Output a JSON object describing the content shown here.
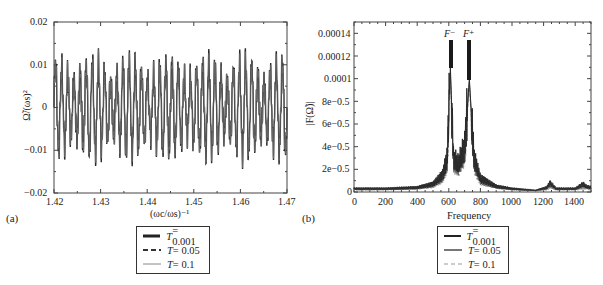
{
  "chart_data": [
    {
      "panel": "(a)",
      "type": "line",
      "title": "",
      "xlabel": "(ω_c/ω_s)^-1",
      "ylabel": "Ω̃/(ω_s)^2",
      "xlim": [
        1.42,
        1.47
      ],
      "ylim": [
        -0.02,
        0.02
      ],
      "x_ticks": [
        "1.42",
        "1.43",
        "1.44",
        "1.45",
        "1.46",
        "1.47"
      ],
      "y_ticks": [
        "-0.02",
        "-0.01",
        "0",
        "0.01",
        "0.02"
      ],
      "grid": false,
      "legend_position": "below",
      "series": [
        {
          "name": "T = 0.001",
          "style": "thick solid",
          "description": "oscillating signal, amplitude roughly between -0.013 and 0.013"
        },
        {
          "name": "T = 0.05",
          "style": "dashed",
          "description": "nearly overlapping oscillation"
        },
        {
          "name": "T = 0.1",
          "style": "thin solid gray",
          "description": "nearly overlapping oscillation"
        }
      ],
      "approx_peaks": [
        {
          "x": 1.4215,
          "y": 0.01
        },
        {
          "x": 1.4235,
          "y": 0.01
        },
        {
          "x": 1.4275,
          "y": 0.012
        },
        {
          "x": 1.429,
          "y": 0.011
        },
        {
          "x": 1.4355,
          "y": 0.01
        },
        {
          "x": 1.437,
          "y": 0.013
        },
        {
          "x": 1.4385,
          "y": 0.009
        },
        {
          "x": 1.445,
          "y": 0.013
        },
        {
          "x": 1.453,
          "y": 0.01
        },
        {
          "x": 1.4545,
          "y": 0.012
        },
        {
          "x": 1.462,
          "y": 0.013
        },
        {
          "x": 1.4635,
          "y": 0.01
        }
      ],
      "approx_troughs": [
        {
          "x": 1.428,
          "y": -0.013
        },
        {
          "x": 1.436,
          "y": -0.0125
        },
        {
          "x": 1.4445,
          "y": -0.011
        },
        {
          "x": 1.4455,
          "y": -0.0115
        },
        {
          "x": 1.4535,
          "y": -0.0125
        },
        {
          "x": 1.463,
          "y": -0.0125
        }
      ]
    },
    {
      "panel": "(b)",
      "type": "line",
      "title": "",
      "xlabel": "Frequency",
      "ylabel": "|F(Ω̃)|",
      "xlim": [
        0,
        1500
      ],
      "ylim": [
        0,
        0.00015
      ],
      "x_ticks": [
        "0",
        "200",
        "400",
        "600",
        "800",
        "1000",
        "1200",
        "1400"
      ],
      "y_ticks": [
        "0",
        "2e-0.5",
        "4e-0.5",
        "6e-0.5",
        "8e-0.5",
        "0.0001",
        "0.00012",
        "0.00014"
      ],
      "grid": false,
      "legend_position": "below",
      "annotations": [
        {
          "text": "F⁻",
          "x": 610,
          "marker_top": 0.000135,
          "marker_bottom": 0.000112
        },
        {
          "text": "F⁺",
          "x": 730,
          "marker_top": 0.000135,
          "marker_bottom": 0.000102
        }
      ],
      "series": [
        {
          "name": "T = 0.001",
          "style": "solid dark",
          "x": [
            0,
            200,
            400,
            500,
            560,
            590,
            610,
            630,
            660,
            700,
            730,
            760,
            800,
            900,
            1000,
            1150,
            1220,
            1240,
            1280,
            1400,
            1450,
            1470,
            1500
          ],
          "y": [
            3e-06,
            3e-06,
            4e-06,
            7e-06,
            1.5e-05,
            3e-05,
            0.00011,
            3e-05,
            2.5e-05,
            4e-05,
            0.0001,
            3e-05,
            1.2e-05,
            5e-06,
            3e-06,
            1.5e-06,
            4e-06,
            8e-06,
            3e-06,
            3e-06,
            7e-06,
            5e-06,
            4e-06
          ]
        },
        {
          "name": "T = 0.05",
          "style": "solid gray",
          "x": [
            0,
            200,
            400,
            500,
            560,
            590,
            610,
            630,
            660,
            700,
            730,
            760,
            800,
            900,
            1000,
            1150,
            1220,
            1240,
            1280,
            1400,
            1450,
            1470,
            1500
          ],
          "y": [
            2.5e-06,
            2.5e-06,
            3.5e-06,
            6e-06,
            1.3e-05,
            2.7e-05,
            0.000105,
            2.7e-05,
            2.2e-05,
            3.6e-05,
            9.7e-05,
            2.7e-05,
            1e-05,
            4.5e-06,
            2.5e-06,
            1.2e-06,
            3e-06,
            6e-06,
            2.5e-06,
            2.5e-06,
            5e-06,
            4e-06,
            3e-06
          ]
        },
        {
          "name": "T = 0.1",
          "style": "dashed light",
          "x": [
            0,
            200,
            400,
            500,
            560,
            590,
            610,
            630,
            660,
            700,
            730,
            760,
            800,
            900,
            1000,
            1150,
            1220,
            1240,
            1280,
            1400,
            1450,
            1470,
            1500
          ],
          "y": [
            2e-06,
            2e-06,
            3e-06,
            5e-06,
            1.1e-05,
            2.4e-05,
            0.0001,
            2.4e-05,
            2e-05,
            3.3e-05,
            9.4e-05,
            2.4e-05,
            9e-06,
            4e-06,
            2e-06,
            1e-06,
            2e-06,
            4e-06,
            2e-06,
            2e-06,
            3e-06,
            3e-06,
            2e-06
          ]
        }
      ]
    }
  ],
  "panels": {
    "a": {
      "label": "(a)",
      "ylabel": "Ω̃/(ωs)²",
      "xlabel": "(ωc/ωs)⁻¹",
      "yticks": [
        "0.02",
        "0.01",
        "0",
        "−0.01",
        "−0.02"
      ],
      "xticks": [
        "1.42",
        "1.43",
        "1.44",
        "1.45",
        "1.46",
        "1.47"
      ],
      "legend": [
        {
          "t": "T",
          "val": " = 0.001"
        },
        {
          "t": "T",
          "val": " = 0.05"
        },
        {
          "t": "T",
          "val": " = 0.1"
        }
      ]
    },
    "b": {
      "label": "(b)",
      "ylabel": "|F(Ω̃)|",
      "xlabel": "Frequency",
      "yticks": [
        "0.00014",
        "0.00012",
        "0.0001",
        "8e−0.5",
        "6e−0.5",
        "4e−0.5",
        "2e−0.5",
        "0"
      ],
      "xticks": [
        "0",
        "200",
        "400",
        "600",
        "800",
        "1000",
        "1200",
        "1400"
      ],
      "ann_minus": "F⁻",
      "ann_plus": "F⁺",
      "legend": [
        {
          "t": "T",
          "val": " = 0.001"
        },
        {
          "t": "T",
          "val": " = 0.05"
        },
        {
          "t": "T",
          "val": " = 0.1"
        }
      ]
    }
  }
}
